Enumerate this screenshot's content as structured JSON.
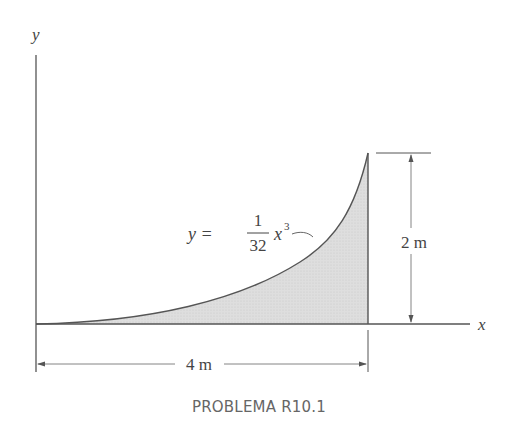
{
  "diagram": {
    "axes": {
      "x_label": "x",
      "y_label": "y"
    },
    "curve": {
      "equation_lhs": "y =",
      "fraction_numerator": "1",
      "fraction_denominator": "32",
      "equation_var": "x",
      "equation_exp": "3",
      "x_range": [
        0,
        4
      ],
      "y_max": 2
    },
    "dimensions": {
      "width_label": "4 m",
      "height_label": "2 m"
    },
    "colors": {
      "fill": "#d9d9d9",
      "line": "#555555",
      "text": "#444444"
    }
  },
  "caption": "PROBLEMA R10.1"
}
